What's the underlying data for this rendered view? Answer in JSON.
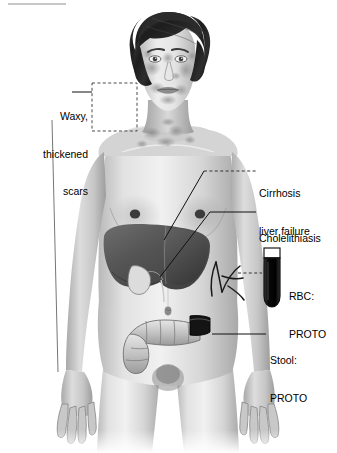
{
  "figure": {
    "title_rule_visible": true,
    "background_color": "#ffffff",
    "ink_color": "#000000"
  },
  "annotations": [
    {
      "id": "waxy-scars",
      "lines": [
        "Waxy,",
        "thickened",
        "scars"
      ],
      "align": "right",
      "x": 10,
      "y": 85,
      "width": 78
    },
    {
      "id": "cirrhosis",
      "lines": [
        "Cirrhosis",
        "liver failure"
      ],
      "align": "left",
      "x": 259,
      "y": 162,
      "width": 78
    },
    {
      "id": "cholelithiasis",
      "lines": [
        "Cholelithiasis"
      ],
      "align": "left",
      "x": 259,
      "y": 207,
      "width": 78
    },
    {
      "id": "rbc-proto",
      "lines": [
        "RBC:",
        "PROTO"
      ],
      "align": "left",
      "x": 293,
      "y": 265,
      "width": 44
    },
    {
      "id": "stool-proto",
      "lines": [
        "Stool:",
        "PROTO"
      ],
      "align": "left",
      "x": 270,
      "y": 329,
      "width": 60
    }
  ],
  "anatomy_features": [
    {
      "id": "head-hair",
      "label": "hair",
      "color": "#262626"
    },
    {
      "id": "face-scarring",
      "label": "mottled facial scarring",
      "color": "#9a9a9a"
    },
    {
      "id": "liver",
      "label": "liver",
      "color": "#5a5a5a"
    },
    {
      "id": "gallbladder",
      "label": "gallbladder",
      "color": "#d8d8d8"
    },
    {
      "id": "colon",
      "label": "large intestine",
      "color": "#bdbdbd"
    },
    {
      "id": "stool-segment",
      "label": "dark stool segment",
      "color": "#141414"
    },
    {
      "id": "forearm-veins",
      "label": "forearm veins",
      "color": "#1c1c1c"
    },
    {
      "id": "skin",
      "label": "skin",
      "color": "#cfcfcf"
    }
  ],
  "specimen_tube": {
    "id": "blood-test-tube",
    "label": "blood specimen tube",
    "fill_color": "#0d0d0d",
    "rim_color": "#ffffff",
    "x": 264,
    "y": 248,
    "width": 16,
    "height": 58
  },
  "dashed_box": {
    "id": "face-scar-highlight-box",
    "x": 92,
    "y": 83,
    "width": 45,
    "height": 48
  },
  "top_rule": {
    "x1": 8,
    "y1": 4,
    "x2": 66,
    "y2": 4
  }
}
